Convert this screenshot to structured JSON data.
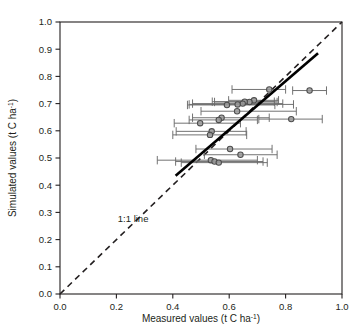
{
  "chart_data": {
    "type": "scatter",
    "title": "",
    "xlabel": "Measured values (t C ha⁻¹)",
    "ylabel": "Simulated values (t C ha⁻¹)",
    "xlim": [
      0.0,
      1.0
    ],
    "ylim": [
      0.0,
      1.0
    ],
    "xticks": [
      "0.0",
      "0.2",
      "0.4",
      "0.6",
      "0.8",
      "1.0"
    ],
    "xtick_values": [
      0.0,
      0.2,
      0.4,
      0.6,
      0.8,
      1.0
    ],
    "yticks": [
      "0.0",
      "0.1",
      "0.2",
      "0.3",
      "0.4",
      "0.5",
      "0.6",
      "0.7",
      "0.8",
      "0.9",
      "1.0"
    ],
    "ytick_values": [
      0.0,
      0.1,
      0.2,
      0.3,
      0.4,
      0.5,
      0.6,
      0.7,
      0.8,
      0.9,
      1.0
    ],
    "grid": false,
    "legend_position": "none",
    "annotations": [
      {
        "text": "1:1 line",
        "x": 0.205,
        "y": 0.265
      }
    ],
    "reference_line": {
      "name": "1:1 line",
      "style": "dashed",
      "color": "#231f20",
      "x0": 0.0,
      "y0": 0.0,
      "x1": 1.0,
      "y1": 1.0
    },
    "regression_line": {
      "name": "regression fit",
      "style": "solid",
      "color": "#000000",
      "x0": 0.41,
      "y0": 0.435,
      "x1": 0.915,
      "y1": 0.885
    },
    "marker": {
      "shape": "circle",
      "fill": "#9a9a9a",
      "edge": "#4d4d4d",
      "size_px": 5.4
    },
    "errorbar": {
      "orientation": "horizontal",
      "color": "#6b6b6b",
      "cap": true
    },
    "points": [
      {
        "x": 0.885,
        "y": 0.748,
        "xerr_low": 0.825,
        "xerr_high": 0.945
      },
      {
        "x": 0.742,
        "y": 0.752,
        "xerr_low": 0.61,
        "xerr_high": 0.8
      },
      {
        "x": 0.688,
        "y": 0.712,
        "xerr_low": 0.598,
        "xerr_high": 0.775
      },
      {
        "x": 0.672,
        "y": 0.706,
        "xerr_low": 0.548,
        "xerr_high": 0.77
      },
      {
        "x": 0.655,
        "y": 0.707,
        "xerr_low": 0.54,
        "xerr_high": 0.76
      },
      {
        "x": 0.648,
        "y": 0.7,
        "xerr_low": 0.47,
        "xerr_high": 0.79
      },
      {
        "x": 0.63,
        "y": 0.697,
        "xerr_low": 0.458,
        "xerr_high": 0.828
      },
      {
        "x": 0.592,
        "y": 0.695,
        "xerr_low": 0.452,
        "xerr_high": 0.762
      },
      {
        "x": 0.628,
        "y": 0.672,
        "xerr_low": 0.5,
        "xerr_high": 0.838
      },
      {
        "x": 0.82,
        "y": 0.643,
        "xerr_low": 0.705,
        "xerr_high": 0.93
      },
      {
        "x": 0.573,
        "y": 0.648,
        "xerr_low": 0.47,
        "xerr_high": 0.742
      },
      {
        "x": 0.563,
        "y": 0.64,
        "xerr_low": 0.458,
        "xerr_high": 0.7
      },
      {
        "x": 0.497,
        "y": 0.628,
        "xerr_low": 0.405,
        "xerr_high": 0.64
      },
      {
        "x": 0.538,
        "y": 0.598,
        "xerr_low": 0.412,
        "xerr_high": 0.66
      },
      {
        "x": 0.532,
        "y": 0.585,
        "xerr_low": 0.4,
        "xerr_high": 0.662
      },
      {
        "x": 0.603,
        "y": 0.533,
        "xerr_low": 0.482,
        "xerr_high": 0.752
      },
      {
        "x": 0.64,
        "y": 0.512,
        "xerr_low": 0.512,
        "xerr_high": 0.77
      },
      {
        "x": 0.535,
        "y": 0.492,
        "xerr_low": 0.345,
        "xerr_high": 0.7
      },
      {
        "x": 0.548,
        "y": 0.487,
        "xerr_low": 0.41,
        "xerr_high": 0.72
      },
      {
        "x": 0.563,
        "y": 0.483,
        "xerr_low": 0.43,
        "xerr_high": 0.735
      }
    ]
  }
}
